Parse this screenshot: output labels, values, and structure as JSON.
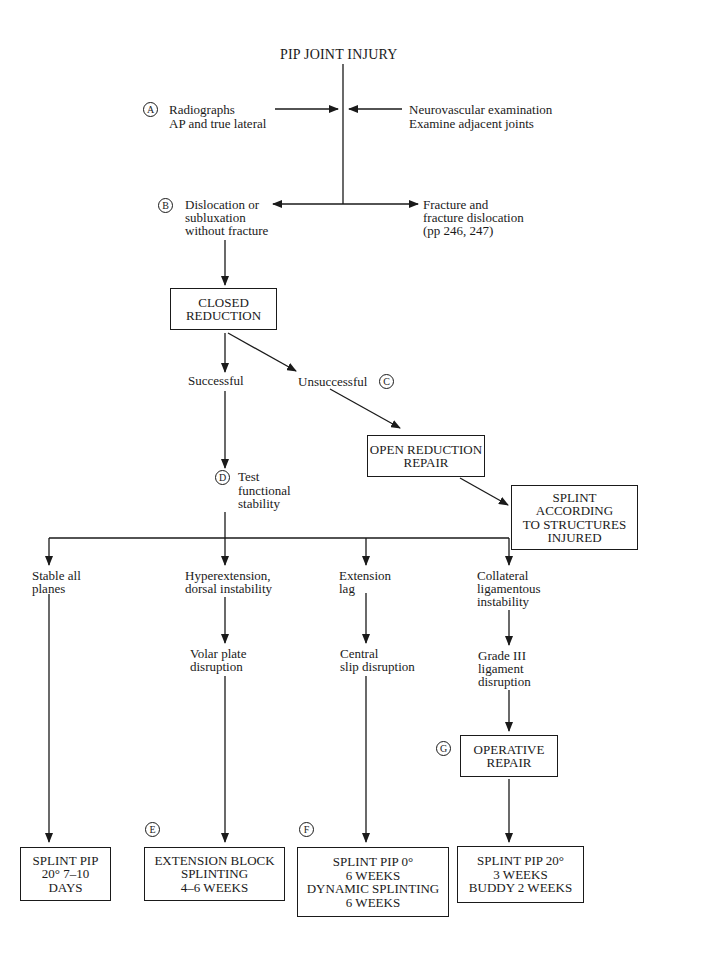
{
  "title": "PIP JOINT INJURY",
  "markers": {
    "a": "A",
    "b": "B",
    "c": "C",
    "d": "D",
    "e": "E",
    "f": "F",
    "g": "G"
  },
  "inputs_left": {
    "line1": "Radiographs",
    "line2": "AP and true lateral"
  },
  "inputs_right": {
    "line1": "Neurovascular examination",
    "line2": "Examine adjacent joints"
  },
  "branch_b": {
    "lines": [
      "Dislocation or",
      "subluxation",
      "without fracture"
    ]
  },
  "branch_fracture": {
    "lines": [
      "Fracture and",
      "fracture dislocation",
      "(pp 246, 247)"
    ]
  },
  "closed_reduction": {
    "lines": [
      "CLOSED",
      "REDUCTION"
    ]
  },
  "successful": "Successful",
  "unsuccessful": "Unsuccessful",
  "open_reduction": {
    "lines": [
      "OPEN REDUCTION",
      "REPAIR"
    ]
  },
  "splint_according": {
    "lines": [
      "SPLINT",
      "ACCORDING",
      "TO STRUCTURES",
      "INJURED"
    ]
  },
  "test_stability": {
    "lines": [
      "Test",
      "functional",
      "stability"
    ]
  },
  "columns": [
    {
      "condition": [
        "Stable all",
        "planes"
      ],
      "finding": [],
      "treatment": [
        "SPLINT PIP",
        "20° 7–10",
        "DAYS"
      ]
    },
    {
      "condition": [
        "Hyperextension,",
        "dorsal instability"
      ],
      "finding": [
        "Volar plate",
        "disruption"
      ],
      "treatment": [
        "EXTENSION BLOCK",
        "SPLINTING",
        "4–6 WEEKS"
      ]
    },
    {
      "condition": [
        "Extension",
        "lag"
      ],
      "finding": [
        "Central",
        "slip disruption"
      ],
      "treatment": [
        "SPLINT PIP 0°",
        "6 WEEKS",
        "DYNAMIC SPLINTING",
        "6 WEEKS"
      ]
    },
    {
      "condition": [
        "Collateral",
        "ligamentous",
        "instability"
      ],
      "finding": [
        "Grade III",
        "ligament",
        "disruption"
      ],
      "treatment": [
        "SPLINT PIP 20°",
        "3 WEEKS",
        "BUDDY 2 WEEKS"
      ]
    }
  ],
  "operative_repair": {
    "lines": [
      "OPERATIVE",
      "REPAIR"
    ]
  }
}
